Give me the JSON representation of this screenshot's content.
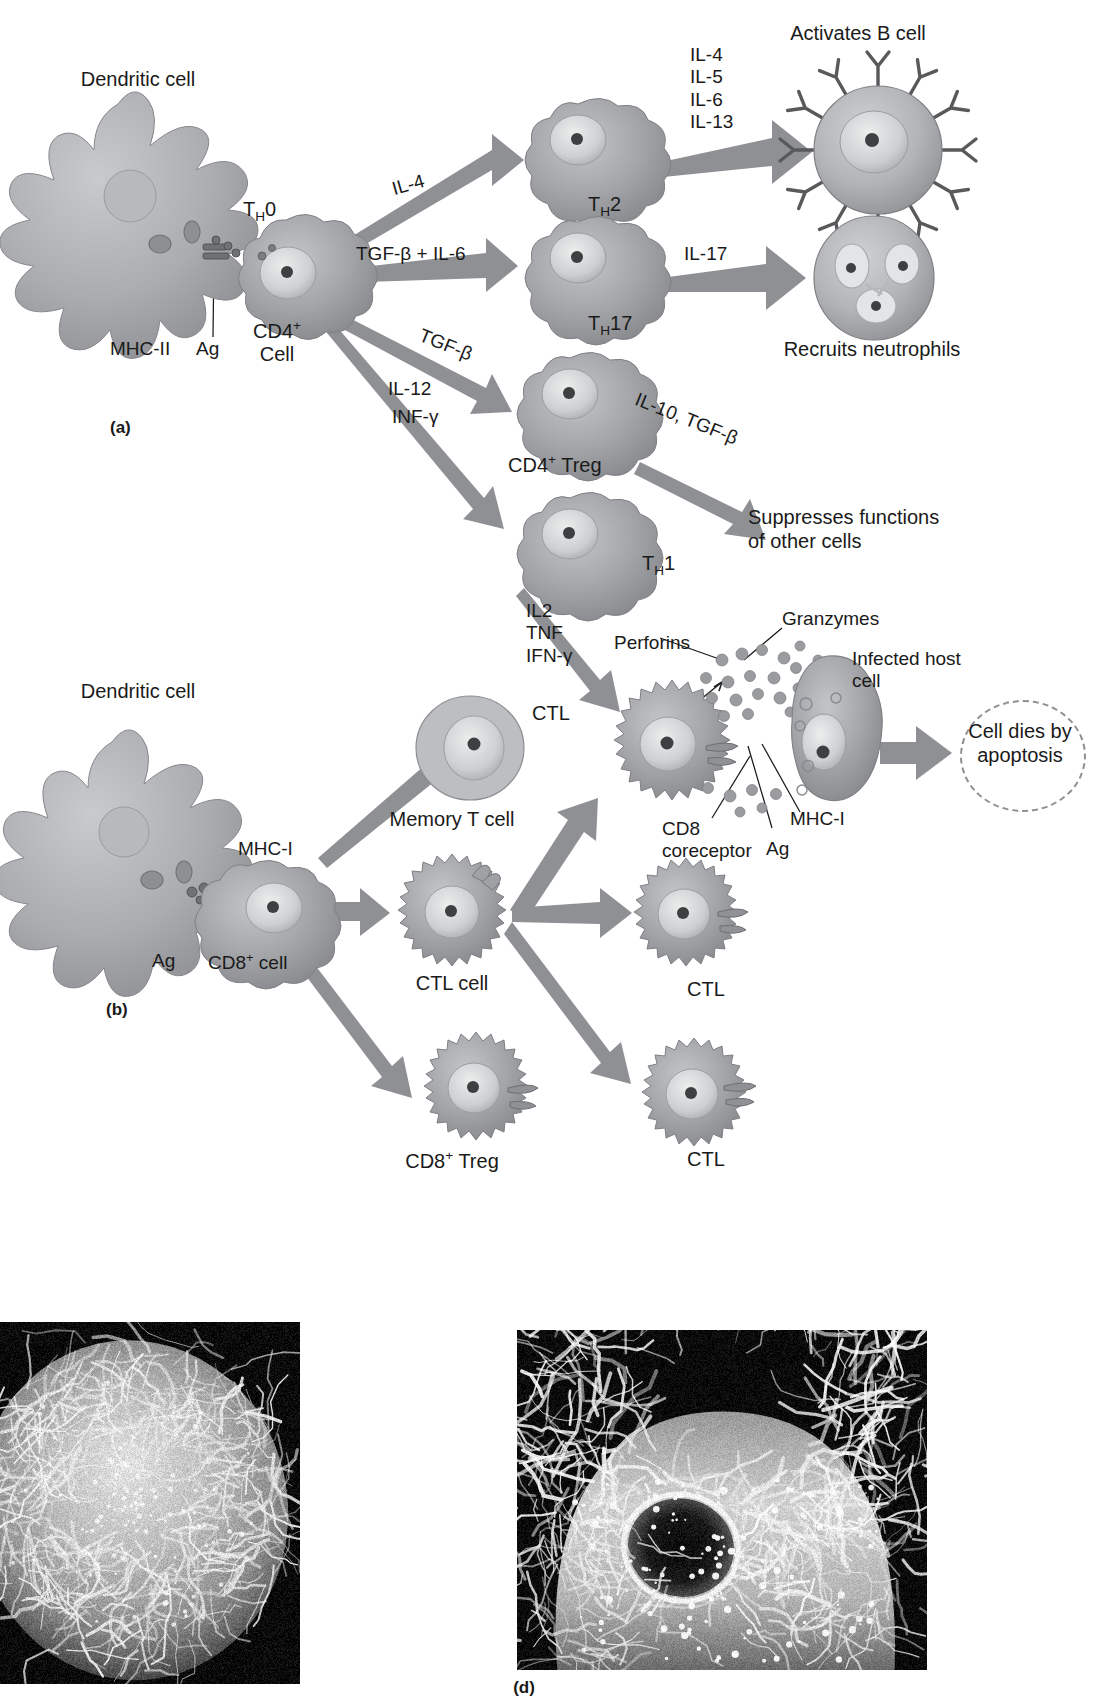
{
  "figure": {
    "type": "biological-pathway-diagram",
    "panels": [
      {
        "id": "a",
        "label": "(a)",
        "topic": "CD4+ T helper cell differentiation"
      },
      {
        "id": "b",
        "label": "(b)",
        "topic": "CD8+ cytotoxic T lymphocyte activation"
      },
      {
        "id": "d",
        "label": "(d)",
        "topic": "Scanning electron micrographs"
      }
    ]
  },
  "panel_a": {
    "panel_label": "(a)",
    "cells": {
      "dendritic": "Dendritic cell",
      "th0": "T<sub>H</sub>0",
      "th0_plain": "THO",
      "cd4_cell_line1": "CD4+",
      "cd4_cell_line2": "Cell",
      "mhc_ii": "MHC-II",
      "ag": "Ag",
      "th2": "TH2",
      "th17": "TH17",
      "treg": "CD4+ Treg",
      "th1": "TH1",
      "b_cell": "Activates B cell",
      "neutrophil": "Recruits neutrophils",
      "suppress_line1": "Suppresses functions",
      "suppress_line2": "of other cells"
    },
    "arrow_labels": {
      "to_th2": "IL-4",
      "to_th17": "TGF-β + IL-6",
      "to_treg": "TGF-β",
      "to_th1_line1": "IL-12",
      "to_th1_line2": "INF-γ",
      "th2_to_b_cell": [
        "IL-4",
        "IL-5",
        "IL-6",
        "IL-13"
      ],
      "th17_to_neutrophil": "IL-17",
      "treg_to_suppress": "IL-10, TGF-β"
    }
  },
  "panel_b": {
    "panel_label": "(b)",
    "cells": {
      "dendritic": "Dendritic cell",
      "mhc_i_left": "MHC-I",
      "ag_left": "Ag",
      "cd8_cell": "CD8+ cell",
      "memory_t": "Memory T cell",
      "ctl_cell": "CTL cell",
      "ctl_top_right": "CTL",
      "ctl_bottom_right": "CTL",
      "cd8_treg": "CD8+ Treg",
      "ctl_effector": "CTL",
      "infected_line1": "Infected host",
      "infected_line2": "cell",
      "apoptosis_line1": "Cell dies by",
      "apoptosis_line2": "apoptosis"
    },
    "arrow_labels": {
      "th1_to_ctl": [
        "IL2",
        "TNF",
        "IFN-γ"
      ]
    },
    "annotations": {
      "perforins": "Perforins",
      "granzymes": "Granzymes",
      "cd8_coreceptor_line1": "CD8",
      "cd8_coreceptor_line2": "coreceptor",
      "ag_right": "Ag",
      "mhc_i_right": "MHC-I"
    }
  },
  "panel_d": {
    "panel_label": "(d)"
  },
  "colors": {
    "text": "#1a1a1a",
    "arrow_fill": "#8e9094",
    "arrow_stroke": "#7b7d81",
    "cell_body": "#9a9ca0",
    "cell_body_light": "#b9bbbe",
    "cell_nucleus": "#d8d9da",
    "nucleolus": "#4a4b4d",
    "dendritic_body": "#a8aaad",
    "dashed_outline": "#8d8f93",
    "micrograph_bg": "#0d0d0d",
    "page_bg": "#ffffff"
  }
}
